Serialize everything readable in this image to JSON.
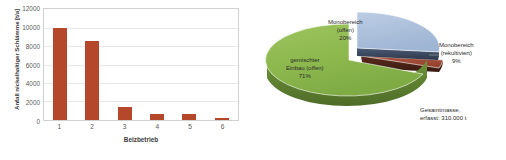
{
  "chart_data": [
    {
      "type": "bar",
      "title": "",
      "xlabel": "Beizbetrieb",
      "ylabel": "Anfall nickelhaltiger Schlämme [t/a]",
      "categories": [
        "1",
        "2",
        "3",
        "4",
        "5",
        "6"
      ],
      "values": [
        10000,
        8500,
        1450,
        650,
        640,
        180
      ],
      "ylim": [
        0,
        12000
      ],
      "yticks": [
        0,
        2000,
        4000,
        6000,
        8000,
        10000,
        12000
      ],
      "ytick_labels": [
        "0",
        "2000",
        "4000",
        "6000",
        "8000",
        "10000",
        "12000"
      ],
      "grid": true,
      "legend": "none",
      "bar_color": "#b5472a"
    },
    {
      "type": "pie",
      "title": "",
      "labels": [
        "gemischter Einbau (offen)",
        "Monobereich (offen)",
        "Monobereich (rekultiviert)"
      ],
      "values": [
        71,
        20,
        9
      ],
      "value_labels": [
        "71%",
        "20%",
        "9%"
      ],
      "colors": [
        "#8cb84e",
        "#a9bddb",
        "#9e4a3c"
      ],
      "annotation": "Gesamtmasse, erfasst: 310.000 t",
      "legend": "none",
      "three_d": true,
      "exploded": true
    }
  ],
  "bar_chart": {
    "ylabel": "Anfall nickelhaltiger Schlämme [t/a]",
    "xlabel": "Beizbetrieb",
    "ytick_labels": [
      "12000",
      "10000",
      "8000",
      "6000",
      "4000",
      "2000",
      "0"
    ],
    "xtick_labels": [
      "1",
      "2",
      "3",
      "4",
      "5",
      "6"
    ]
  },
  "pie_chart": {
    "label_mono_offen": {
      "line1": "Monobereich",
      "line2": "(offen)",
      "pct": "20%"
    },
    "label_gemischt": {
      "line1": "gemischter",
      "line2": "Einbau (offen)",
      "pct": "71%"
    },
    "label_mono_rekultiviert": {
      "line1": "Monobereich",
      "line2": "(rekultiviert)",
      "pct": "9%"
    },
    "label_gesamt": {
      "line1": "Gesamtmasse,",
      "line2": "erfasst: 310.000 t"
    }
  }
}
